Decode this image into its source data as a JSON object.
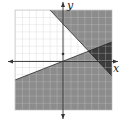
{
  "figure": {
    "type": "system-of-linear-inequalities-graph",
    "axes": {
      "x_label": "x",
      "y_label": "y"
    },
    "grid": {
      "x_range": [
        -7,
        7
      ],
      "y_range": [
        -7,
        7
      ],
      "step": 1
    },
    "lines": [
      {
        "name": "boundary-line-falling",
        "style": "solid",
        "points": [
          [
            -2,
            7
          ],
          [
            3.6,
            1.4
          ],
          [
            7,
            -2.2
          ]
        ]
      },
      {
        "name": "boundary-line-rising",
        "style": "solid",
        "points": [
          [
            -7,
            -2.8
          ],
          [
            0,
            0
          ],
          [
            7,
            2.8
          ]
        ]
      }
    ],
    "regions": [
      {
        "name": "shaded-above-falling-line",
        "shade": "medium-gray"
      },
      {
        "name": "shaded-below-rising-line",
        "shade": "medium-gray"
      },
      {
        "name": "overlap-solution-region",
        "shade": "dark-gray"
      },
      {
        "name": "unshaded-region",
        "shade": "white"
      }
    ],
    "marker": {
      "name": "test-point",
      "coords": [
        0,
        1
      ]
    },
    "colors": {
      "light_shade": "#8c8c8c",
      "dark_shade": "#3c3c3c",
      "grid": "#c8c8c8",
      "axis": "#333333",
      "background": "#ffffff"
    }
  }
}
